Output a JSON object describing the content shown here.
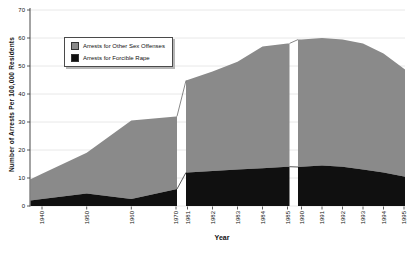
{
  "figure": {
    "background": "#ffffff"
  },
  "chart_data": {
    "type": "area",
    "stacked": true,
    "title": "",
    "xlabel": "Year",
    "ylabel": "Number of Arrests Per 100,000 Residents",
    "ylim": [
      0,
      70
    ],
    "yticks": [
      0,
      10,
      20,
      30,
      40,
      50,
      60,
      70
    ],
    "grid": "horizontal light-gray gridlines at every 10 units",
    "x_axis_breaks": [
      "between 1970 and 1981",
      "between 1985 and 1990"
    ],
    "legend_position": "inside upper-left",
    "legend_entries": [
      {
        "label": "Arrests for Other Sex Offenses",
        "color": "#8a8a8a"
      },
      {
        "label": "Arrests for Forcible Rape",
        "color": "#101010"
      }
    ],
    "series_order_bottom_to_top": [
      "Arrests for Forcible Rape",
      "Arrests for Other Sex Offenses"
    ],
    "segments": [
      {
        "years": [
          1940,
          1950,
          1960,
          1970
        ],
        "forcible_rape": [
          2.5,
          4.5,
          2.5,
          6
        ],
        "other_sex_offenses": [
          9,
          14.5,
          28,
          26
        ],
        "total": [
          11.5,
          19,
          30.5,
          32
        ]
      },
      {
        "years": [
          1981,
          1982,
          1983,
          1984,
          1985
        ],
        "forcible_rape": [
          12,
          12.5,
          13,
          13.5,
          14
        ],
        "other_sex_offenses": [
          33,
          35.5,
          38.5,
          43.5,
          44
        ],
        "total": [
          45,
          48,
          51.5,
          57,
          58
        ]
      },
      {
        "years": [
          1990,
          1991,
          1992,
          1993,
          1994,
          1995
        ],
        "forcible_rape": [
          14,
          14.5,
          14,
          13,
          12,
          10.5
        ],
        "other_sex_offenses": [
          45.5,
          45.5,
          45.5,
          45,
          42.5,
          38.5
        ],
        "total": [
          59.5,
          60,
          59.5,
          58,
          54.5,
          49
        ]
      }
    ],
    "colors": {
      "other_sex_offenses_area": "#8a8a8a",
      "forcible_rape_area": "#101010",
      "gridline": "#e2e2e2",
      "axis": "#333333",
      "text": "#111111"
    }
  }
}
